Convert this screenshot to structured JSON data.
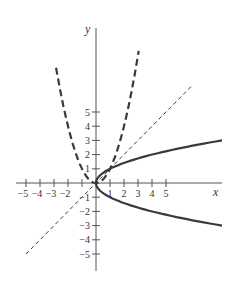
{
  "chart_data": {
    "type": "line",
    "title": "",
    "xlabel": "x",
    "ylabel": "y",
    "xlim": [
      -5.7,
      9.1
    ],
    "ylim": [
      -6.1,
      10.9
    ],
    "grid": false,
    "legend": "none",
    "x_ticks": [
      -5,
      -4,
      -3,
      -2,
      -1,
      1,
      2,
      3,
      4,
      5
    ],
    "x_tick_labels": [
      "−5",
      "−4",
      "−3",
      "−2",
      "",
      "1",
      "2",
      "3",
      "4",
      "5"
    ],
    "y_ticks": [
      -5,
      -4,
      -3,
      -2,
      -1,
      1,
      2,
      3,
      4,
      5
    ],
    "y_tick_labels": [
      "−5",
      "−4",
      "−3",
      "−2",
      "−1",
      "1",
      "2",
      "3",
      "4",
      "5"
    ],
    "series": [
      {
        "name": "y = x^2",
        "style": "long-dash",
        "equation": "y = x^2",
        "x_range": [
          -2.85,
          3.05
        ]
      },
      {
        "name": "y = x",
        "style": "short-dash",
        "equation": "y = x",
        "x_range": [
          -5,
          6.9
        ]
      },
      {
        "name": "x = y^2",
        "style": "solid",
        "equation": "x = y^2",
        "y_range": [
          -3,
          3
        ]
      }
    ],
    "colors": {
      "curve": "#3a3a3a",
      "axis": "#555555"
    }
  }
}
